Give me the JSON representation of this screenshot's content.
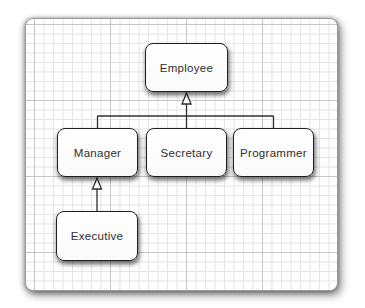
{
  "diagram": {
    "kind": "uml-class-hierarchy",
    "nodes": [
      {
        "id": "employee",
        "label": "Employee"
      },
      {
        "id": "manager",
        "label": "Manager"
      },
      {
        "id": "secretary",
        "label": "Secretary"
      },
      {
        "id": "programmer",
        "label": "Programmer"
      },
      {
        "id": "executive",
        "label": "Executive"
      }
    ],
    "edges": [
      {
        "from": "manager",
        "to": "employee",
        "type": "generalization"
      },
      {
        "from": "secretary",
        "to": "employee",
        "type": "generalization"
      },
      {
        "from": "programmer",
        "to": "employee",
        "type": "generalization"
      },
      {
        "from": "executive",
        "to": "manager",
        "type": "generalization"
      }
    ],
    "colors": {
      "canvas_background": "#fefefe",
      "grid_minor": "#e4e4e4",
      "grid_major": "#c6c6c6",
      "node_fill": "#ffffff",
      "node_border": "#1f1f1f",
      "node_text": "#2e2e2e",
      "connector": "#2e2e2e",
      "panel_border": "#9b9b9b"
    }
  }
}
